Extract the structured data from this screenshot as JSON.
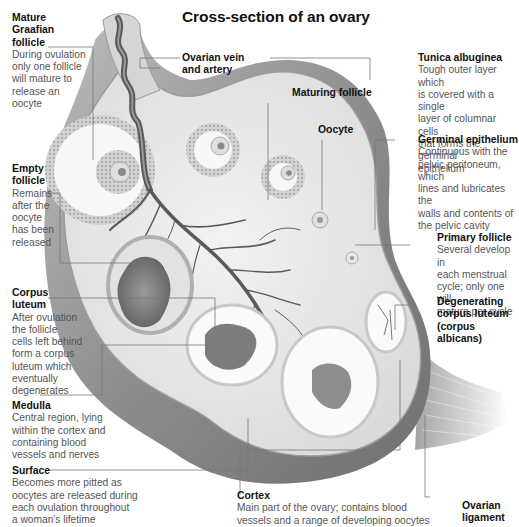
{
  "title": "Cross-section of an ovary",
  "labels": {
    "mature_graafian_follicle": {
      "title": "Mature Graafian follicle",
      "title_lines": [
        "Mature",
        "Graafian",
        "follicle"
      ],
      "desc_lines": [
        "During ovulation",
        "only one follicle",
        "will mature to",
        "release an",
        "oocyte"
      ]
    },
    "ovarian_vein_artery": {
      "title_lines": [
        "Ovarian vein",
        "and artery"
      ]
    },
    "maturing_follicle": {
      "title_lines": [
        "Maturing follicle"
      ]
    },
    "tunica_albuginea": {
      "title_lines": [
        "Tunica albuginea"
      ],
      "desc_lines": [
        "Tough outer layer which",
        "is covered with a single",
        "layer of columnar cells",
        "that forms the germinal",
        "epithelium"
      ]
    },
    "oocyte": {
      "title_lines": [
        "Oocyte"
      ]
    },
    "germinal_epithelium": {
      "title_lines": [
        "Germinal epithelium"
      ],
      "desc_lines": [
        "Continuous with the",
        "pelvic peritoneum, which",
        "lines and lubricates the",
        "walls and contents of",
        "the pelvic cavity"
      ]
    },
    "empty_follicle": {
      "title_lines": [
        "Empty",
        "follicle"
      ],
      "desc_lines": [
        "Remains",
        "after the",
        "oocyte",
        "has been",
        "released"
      ]
    },
    "primary_follicle": {
      "title_lines": [
        "Primary follicle"
      ],
      "desc_lines": [
        "Several develop in",
        "each menstrual",
        "cycle; only one will",
        "mature per cycle"
      ]
    },
    "corpus_luteum": {
      "title_lines": [
        "Corpus",
        "luteum"
      ],
      "desc_lines": [
        "After ovulation",
        "the follicle",
        "cells left behind",
        "form a corpus",
        "luteum which",
        "eventually",
        "degenerates"
      ]
    },
    "degenerating_corpus_luteum": {
      "title_lines": [
        "Degenerating",
        "corpus luteum",
        "(corpus albicans)"
      ]
    },
    "medulla": {
      "title_lines": [
        "Medulla"
      ],
      "desc_lines": [
        "Central region, lying",
        "within the cortex and",
        "containing blood",
        "vessels and nerves"
      ]
    },
    "surface": {
      "title_lines": [
        "Surface"
      ],
      "desc_lines": [
        "Becomes more pitted as",
        "oocytes are released during",
        "each ovulation throughout",
        "a woman's lifetime"
      ]
    },
    "cortex": {
      "title_lines": [
        "Cortex"
      ],
      "desc_lines": [
        "Main part of the ovary; contains blood",
        "vessels and a range of developing oocytes"
      ]
    },
    "ovarian_ligament": {
      "title_lines": [
        "Ovarian",
        "ligament"
      ]
    }
  },
  "colors": {
    "tissue_light": "#e9e9e9",
    "tissue_mid": "#c8c8c8",
    "tissue_dark": "#8a8a8a",
    "vessel": "#5a5a5a",
    "leader_line": "#777777",
    "label_title": "#111111",
    "label_text": "#555555"
  }
}
